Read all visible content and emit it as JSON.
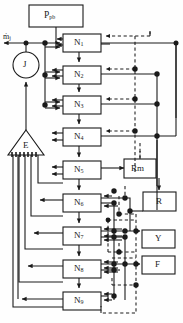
{
  "diagram": {
    "type": "block-diagram",
    "colors": {
      "line": "#1a1a1a",
      "dashed": "#1a1a1a",
      "box_fill": "#ffffff",
      "background": "#fefefe"
    },
    "source_block": {
      "name": "P_pb",
      "label_main": "P",
      "label_sub": "pb"
    },
    "flow_label": {
      "name": "mdot-j",
      "text": "ṁ",
      "sub": "j"
    },
    "junction_node": {
      "name": "J",
      "label": "J",
      "shape": "circle"
    },
    "summer_node": {
      "name": "E",
      "label": "E",
      "shape": "triangle-up",
      "output_lines": 5
    },
    "stages": [
      {
        "label_main": "N",
        "label_sub": "1"
      },
      {
        "label_main": "N",
        "label_sub": "2"
      },
      {
        "label_main": "N",
        "label_sub": "3"
      },
      {
        "label_main": "N",
        "label_sub": "4"
      },
      {
        "label_main": "N",
        "label_sub": "5"
      },
      {
        "label_main": "N",
        "label_sub": "6"
      },
      {
        "label_main": "N",
        "label_sub": "7"
      },
      {
        "label_main": "N",
        "label_sub": "8"
      },
      {
        "label_main": "N",
        "label_sub": "9"
      }
    ],
    "outputs": [
      {
        "label": "Rm"
      },
      {
        "label": "R"
      },
      {
        "label": "Y"
      },
      {
        "label": "F"
      }
    ]
  }
}
